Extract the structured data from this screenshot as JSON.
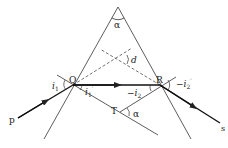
{
  "diagram": {
    "colors": {
      "line": "#222222",
      "background": "#ffffff"
    },
    "labels": {
      "apex_angle": "α",
      "deviation": "d",
      "incident_angle": "i",
      "incident_sub": "1",
      "refracted_angle": "i",
      "refracted_sub": "1",
      "refracted_prime": "′",
      "internal_angle_sign": "−i",
      "internal_sub": "2",
      "exit_angle_sign": "−i",
      "exit_sub": "2",
      "exit_prime": "′",
      "point_q": "Q",
      "point_r": "R",
      "point_t": "T",
      "point_p": "p",
      "point_s": "s",
      "angle_at_t": "α"
    }
  }
}
